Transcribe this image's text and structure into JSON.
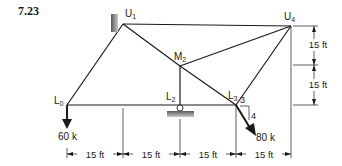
{
  "problem_number": "7.23",
  "nodes": {
    "U1": {
      "label": "U",
      "sub": "1"
    },
    "U4": {
      "label": "U",
      "sub": "4"
    },
    "M2": {
      "label": "M",
      "sub": "2"
    },
    "L0": {
      "label": "L",
      "sub": "0"
    },
    "L2": {
      "label": "L",
      "sub": "2"
    },
    "L3": {
      "label": "L",
      "sub": "3"
    }
  },
  "loads": [
    {
      "at": "L0",
      "label": "60 k",
      "direction": "down"
    },
    {
      "at": "L3",
      "label": "80 k",
      "direction": "slope 3:4",
      "slope_h": "3",
      "slope_v": "4"
    }
  ],
  "supports": [
    {
      "at": "U1",
      "type": "fixed pin (wall)"
    },
    {
      "at": "L2",
      "type": "roller"
    }
  ],
  "dimensions": {
    "horizontal": [
      "15 ft",
      "15 ft",
      "15 ft",
      "15 ft"
    ],
    "vertical": [
      "15 ft",
      "15 ft"
    ]
  },
  "colors": {
    "line": "#1a1a1a",
    "support": "#8a8a8a"
  }
}
